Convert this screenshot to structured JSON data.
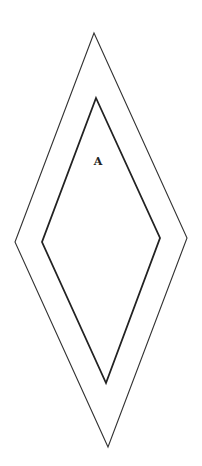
{
  "diagram": {
    "canvas": {
      "width": 202,
      "height": 466,
      "background": "#ffffff"
    },
    "shapes": [
      {
        "name": "outer-rhombus",
        "points": [
          [
            94,
            33
          ],
          [
            187,
            238
          ],
          [
            108,
            447
          ],
          [
            15,
            242
          ]
        ],
        "stroke": "#333333",
        "stroke_width": 1.1
      },
      {
        "name": "inner-rhombus",
        "points": [
          [
            96,
            98
          ],
          [
            160,
            238
          ],
          [
            106,
            383
          ],
          [
            42,
            242
          ]
        ],
        "stroke": "#222222",
        "stroke_width": 1.8
      }
    ],
    "labels": [
      {
        "text": "A",
        "x": 98,
        "y": 161
      }
    ]
  }
}
